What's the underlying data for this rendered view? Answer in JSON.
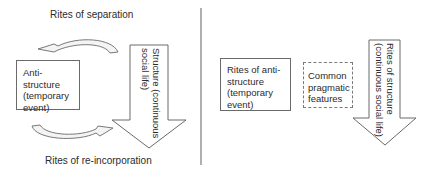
{
  "left_panel": {
    "top_label": "Rites of separation",
    "bottom_label": "Rites of re-incorporation",
    "box_lines": [
      "Anti-structure",
      "(temporary",
      "event)"
    ],
    "arrow_lines": [
      "Structure (continuous",
      "social life)"
    ],
    "top_arrow_direction": "left",
    "bottom_arrow_direction": "right"
  },
  "right_panel": {
    "box1_lines": [
      "Rites of anti-",
      "structure",
      "(temporary",
      "event)"
    ],
    "box2_lines": [
      "Common",
      "pragmatic",
      "features"
    ],
    "arrow_lines": [
      "Rites of structure",
      "(continuous social life)"
    ]
  },
  "colors": {
    "line": "#6a6a6a",
    "text": "#2b2b2b",
    "background": "#ffffff"
  }
}
